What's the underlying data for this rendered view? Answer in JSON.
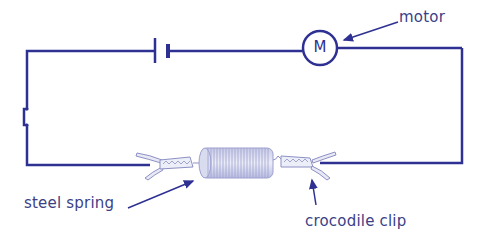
{
  "diagram": {
    "type": "electric circuit",
    "wire_color": "#2e3192",
    "label_color": "#3c3f86",
    "components": [
      {
        "name": "cell",
        "symbol": "battery"
      },
      {
        "name": "motor",
        "symbol": "M"
      },
      {
        "name": "switch",
        "symbol": "switch"
      },
      {
        "name": "steel spring",
        "symbol": "spring"
      },
      {
        "name": "crocodile clip",
        "symbol": "clip"
      }
    ],
    "labels": {
      "motor": "motor",
      "motor_symbol": "M",
      "steel_spring": "steel spring",
      "crocodile_clip": "crocodile clip"
    }
  }
}
